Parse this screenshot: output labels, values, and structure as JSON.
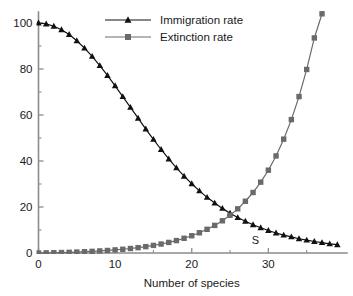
{
  "chart_data": {
    "type": "line",
    "title": "",
    "subtitle": "",
    "xlabel": "Number of species",
    "ylabel": "",
    "xlim": [
      0,
      40
    ],
    "ylim": [
      0,
      104
    ],
    "grid": false,
    "legend_position": "top-center",
    "x_ticks": [
      0,
      10,
      20,
      30
    ],
    "x_tick_labels": [
      "0",
      "10",
      "20",
      "30"
    ],
    "x_minor_ticks": [
      5,
      15,
      25,
      35
    ],
    "y_ticks": [
      0,
      20,
      40,
      60,
      80,
      100
    ],
    "y_tick_labels": [
      "0",
      "20",
      "40",
      "60",
      "80",
      "100"
    ],
    "y_minor_ticks": [
      10,
      30,
      50,
      70,
      90
    ],
    "x": [
      0,
      1,
      2,
      3,
      4,
      5,
      6,
      7,
      8,
      9,
      10,
      11,
      12,
      13,
      14,
      15,
      16,
      17,
      18,
      19,
      20,
      21,
      22,
      23,
      24,
      25,
      26,
      27,
      28,
      29,
      30,
      31,
      32,
      33,
      34,
      35,
      36,
      37,
      38,
      39
    ],
    "series": [
      {
        "name": "Immigration rate",
        "color": "#111111",
        "marker": "triangle",
        "values": [
          100.0,
          99.6,
          98.6,
          97.1,
          95.0,
          92.3,
          89.1,
          85.5,
          81.5,
          77.2,
          72.7,
          68.0,
          63.3,
          58.6,
          53.9,
          49.4,
          45.0,
          40.9,
          37.0,
          33.4,
          30.1,
          27.0,
          24.2,
          21.7,
          19.4,
          17.3,
          15.4,
          13.8,
          12.3,
          11.0,
          9.8,
          8.7,
          7.8,
          7.0,
          6.2,
          5.6,
          5.0,
          4.5,
          4.0,
          3.6
        ]
      },
      {
        "name": "Extinction rate",
        "color": "#6a6a6a",
        "marker": "square",
        "values": [
          0.0,
          0.05,
          0.12,
          0.2,
          0.3,
          0.42,
          0.56,
          0.72,
          0.9,
          1.1,
          1.35,
          1.62,
          1.95,
          2.32,
          2.76,
          3.3,
          3.9,
          4.6,
          5.4,
          6.4,
          7.5,
          8.8,
          10.3,
          12.0,
          14.0,
          16.4,
          19.2,
          22.5,
          26.3,
          30.8,
          36.0,
          42.2,
          49.5,
          58.0,
          68.0,
          79.8,
          93.5,
          104.0,
          116.0,
          130.0
        ]
      }
    ],
    "annotations": [
      {
        "text": "S",
        "x": 28.3,
        "y": 4.0,
        "name": "equilibrium-label"
      }
    ]
  },
  "legend": {
    "items": [
      {
        "label": "Immigration rate",
        "color": "#111111",
        "marker": "triangle"
      },
      {
        "label": "Extinction rate",
        "color": "#6a6a6a",
        "marker": "square"
      }
    ]
  },
  "axes": {
    "x_title": "Number of species"
  }
}
